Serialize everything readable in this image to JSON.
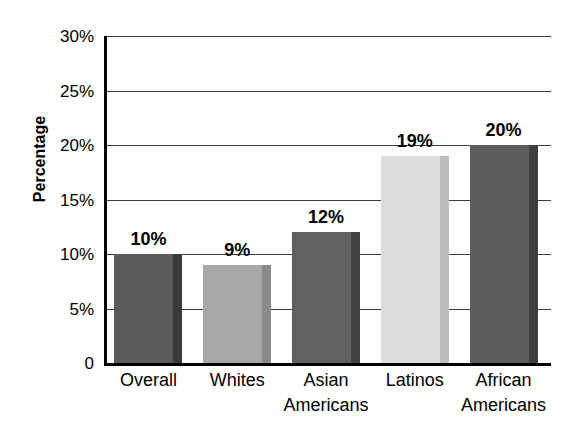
{
  "chart_data": {
    "type": "bar",
    "title": "",
    "xlabel": "",
    "ylabel": "Percentage",
    "ylim": [
      0,
      30
    ],
    "grid": true,
    "legend": "none",
    "unit": "%",
    "categories": [
      "Overall",
      "Whites",
      "Asian Americans",
      "Latinos",
      "African Americans"
    ],
    "category_lines": [
      [
        "Overall",
        ""
      ],
      [
        "Whites",
        ""
      ],
      [
        "Asian",
        "Americans"
      ],
      [
        "Latinos",
        ""
      ],
      [
        "African",
        "Americans"
      ]
    ],
    "values": [
      10,
      9,
      12,
      19,
      20
    ],
    "value_labels": [
      "10%",
      "9%",
      "12%",
      "19%",
      "20%"
    ],
    "bar_colors": [
      "#5a5a5a",
      "#a8a8a8",
      "#616161",
      "#dcdcdc",
      "#5e5e5e"
    ],
    "bar_side_colors": [
      "#3a3a3a",
      "#8a8a8a",
      "#414141",
      "#bdbdbd",
      "#3e3e3e"
    ],
    "y_ticks": [
      {
        "value": 30,
        "label": "30%"
      },
      {
        "value": 25,
        "label": "25%"
      },
      {
        "value": 20,
        "label": "20%"
      },
      {
        "value": 15,
        "label": "15%"
      },
      {
        "value": 10,
        "label": "10%"
      },
      {
        "value": 5,
        "label": "5%"
      },
      {
        "value": 0,
        "label": "0"
      }
    ],
    "axis_color": "#000000",
    "gridline_color": "#3c3c3c",
    "background_color": "#ffffff",
    "text_color": "#000000"
  }
}
